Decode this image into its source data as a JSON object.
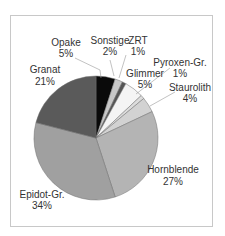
{
  "chart_data": {
    "type": "pie",
    "title": "",
    "categories": [
      "Opake",
      "Sonstige",
      "ZRT",
      "Glimmer",
      "Pyroxen-Gr.",
      "Staurolith",
      "Hornblende",
      "Epidot-Gr.",
      "Granat"
    ],
    "values": [
      5,
      2,
      1,
      5,
      1,
      4,
      27,
      34,
      21
    ],
    "labels": [
      "5%",
      "2%",
      "1%",
      "5%",
      "1%",
      "4%",
      "27%",
      "34%",
      "21%"
    ],
    "colors": [
      "#0a0a0a",
      "#c8c8c8",
      "#555555",
      "#f4f4f4",
      "#dcdcdc",
      "#d2d2d2",
      "#b4b4b4",
      "#a0a0a0",
      "#5a5a5a"
    ],
    "start_angle": "12 o'clock, clockwise",
    "legend": "none (inline labels with leader lines)"
  },
  "labels": {
    "opake": {
      "name": "Opake",
      "pct": "5%"
    },
    "sonstige": {
      "name": "Sonstige",
      "pct": "2%"
    },
    "zrt": {
      "name": "ZRT",
      "pct": "1%"
    },
    "glimmer": {
      "name": "Glimmer",
      "pct": "5%"
    },
    "pyroxen": {
      "name": "Pyroxen-Gr.",
      "pct": "1%"
    },
    "staurolith": {
      "name": "Staurolith",
      "pct": "4%"
    },
    "hornblende": {
      "name": "Hornblende",
      "pct": "27%"
    },
    "epidot": {
      "name": "Epidot-Gr.",
      "pct": "34%"
    },
    "granat": {
      "name": "Granat",
      "pct": "21%"
    }
  }
}
